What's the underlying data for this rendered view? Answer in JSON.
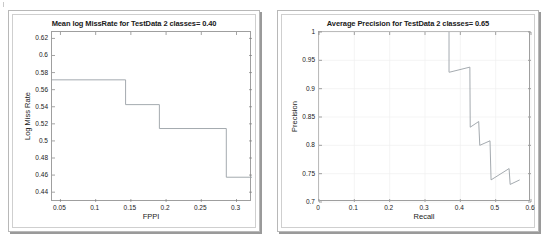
{
  "page": {
    "background": "#ffffff",
    "panel_border_color": "#b8b8b8",
    "axes_color": "#9f9f9f",
    "line_color": "#9aa0a6",
    "grid_color": "#f0f0f0"
  },
  "charts": [
    {
      "id": "miss-rate-chart",
      "chart_data": {
        "type": "line",
        "title": "Mean log MissRate for TestData 2 classes= 0.40",
        "xlabel": "FPPI",
        "ylabel": "Log Miss Rate",
        "xlim": [
          0.038,
          0.322
        ],
        "ylim": [
          0.4285,
          0.6275
        ],
        "xticks": [
          0.05,
          0.1,
          0.15,
          0.2,
          0.25,
          0.3
        ],
        "xticklabels": [
          "0.05",
          "0.1",
          "0.15",
          "0.2",
          "0.25",
          "0.3"
        ],
        "yticks": [
          0.44,
          0.46,
          0.48,
          0.5,
          0.52,
          0.54,
          0.56,
          0.58,
          0.6,
          0.62
        ],
        "yticklabels": [
          "0.44",
          "0.46",
          "0.48",
          "0.5",
          "0.52",
          "0.54",
          "0.56",
          "0.58",
          "0.6",
          "0.62"
        ],
        "grid": false,
        "legend": "none",
        "series": [
          {
            "name": "log miss rate vs FPPI",
            "style": "step-post",
            "x": [
              0.038,
              0.1425,
              0.1425,
              0.1905,
              0.1905,
              0.2855,
              0.2855,
              0.322
            ],
            "y": [
              0.5715,
              0.5715,
              0.5425,
              0.5425,
              0.5145,
              0.5145,
              0.4575,
              0.4575
            ]
          }
        ]
      }
    },
    {
      "id": "precision-recall-chart",
      "chart_data": {
        "type": "line",
        "title": "Average Precision for TestData 2 classes= 0.65",
        "xlabel": "Recall",
        "ylabel": "Precision",
        "xlim": [
          0,
          0.6
        ],
        "ylim": [
          0.7,
          1.0
        ],
        "xticks": [
          0,
          0.1,
          0.2,
          0.3,
          0.4,
          0.5,
          0.6
        ],
        "xticklabels": [
          "0",
          "0.1",
          "0.2",
          "0.3",
          "0.4",
          "0.5",
          "0.6"
        ],
        "yticks": [
          0.7,
          0.75,
          0.8,
          0.85,
          0.9,
          0.95,
          1.0
        ],
        "yticklabels": [
          "0.7",
          "0.75",
          "0.8",
          "0.85",
          "0.9",
          "0.95",
          "1"
        ],
        "grid": true,
        "legend": "none",
        "series": [
          {
            "name": "precision vs recall",
            "style": "sawtooth",
            "x": [
              0.368,
              0.368,
              0.369,
              0.427,
              0.427,
              0.428,
              0.452,
              0.452,
              0.455,
              0.484,
              0.484,
              0.487,
              0.538,
              0.538,
              0.541,
              0.568
            ],
            "y": [
              1.0,
              0.929,
              0.929,
              0.938,
              0.938,
              0.832,
              0.842,
              0.842,
              0.8,
              0.808,
              0.808,
              0.739,
              0.759,
              0.759,
              0.731,
              0.739
            ]
          }
        ]
      }
    }
  ]
}
